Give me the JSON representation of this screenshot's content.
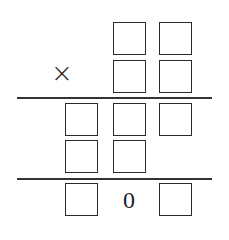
{
  "puzzle": {
    "operator": "×",
    "result_digit": "0",
    "rows": [
      {
        "name": "multiplicand",
        "cells": [
          "",
          "box",
          "box"
        ]
      },
      {
        "name": "multiplier",
        "cells": [
          "",
          "box",
          "box"
        ]
      },
      {
        "name": "partial-product-1",
        "cells": [
          "box",
          "box",
          "box"
        ]
      },
      {
        "name": "partial-product-2",
        "cells": [
          "box",
          "box",
          ""
        ]
      },
      {
        "name": "product",
        "cells": [
          "box",
          "0",
          "box"
        ]
      }
    ],
    "colors": {
      "line": "#333333",
      "box_border": "#2a2a2a",
      "background": "#ffffff"
    }
  }
}
